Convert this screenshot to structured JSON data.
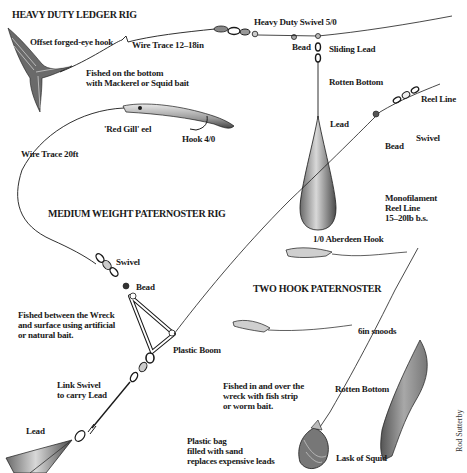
{
  "diagram": {
    "type": "illustrated fishing tackle rig diagram",
    "credit": "Rod Sutterby",
    "rigs": [
      {
        "title": "HEAVY DUTY LEDGER RIG",
        "labels": {
          "hook": "Offset forged-eye hook",
          "trace": "Wire Trace 12–18in",
          "usage_line1": "Fished on the bottom",
          "usage_line2": "with Mackerel or Squid bait",
          "swivel": "Heavy Duty Swivel 5/0",
          "bead": "Bead",
          "sliding_lead": "Sliding Lead",
          "rotten_bottom": "Rotten Bottom",
          "lead": "Lead"
        }
      },
      {
        "title": "MEDIUM WEIGHT PATERNOSTER RIG",
        "labels": {
          "eel": "'Red Gill' eel",
          "hook": "Hook 4/0",
          "trace": "Wire Trace  20ft",
          "reel_line": "Reel Line",
          "swivel_top": "Swivel",
          "bead_top": "Bead",
          "swivel": "Swivel",
          "bead": "Bead",
          "usage_line1": "Fished between the Wreck",
          "usage_line2": "and surface using artificial",
          "usage_line3": "or natural bait.",
          "boom": "Plastic Boom",
          "link_swivel_line1": "Link Swivel",
          "link_swivel_line2": "to carry Lead",
          "lead": "Lead"
        }
      },
      {
        "title": "TWO HOOK PATERNOSTER",
        "labels": {
          "mono_line1": "Monofilament",
          "mono_line2": "Reel Line",
          "mono_line3": "15–20lb b.s.",
          "hook": "1/0 Aberdeen Hook",
          "snoods": "6in snoods",
          "rotten_bottom": "Rotten Bottom",
          "usage_line1": "Fished in and over the",
          "usage_line2": "wreck with fish strip",
          "usage_line3": "or worm bait.",
          "bag_line1": "Plastic bag",
          "bag_line2": "filled with sand",
          "bag_line3": "replaces expensive leads",
          "squid": "Lask of Squid"
        }
      }
    ]
  },
  "colors": {
    "ink": "#1a1a1a",
    "lead_light": "#d8d8d8",
    "lead_dark": "#555555",
    "squid": "#8a8a8a",
    "background": "#ffffff"
  }
}
